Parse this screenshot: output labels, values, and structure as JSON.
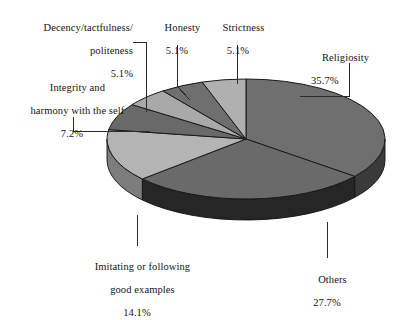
{
  "chart_data": {
    "type": "pie",
    "title": "",
    "subtitle": "",
    "xlabel": "",
    "ylabel": "",
    "units": "%",
    "three_d": true,
    "start_angle_deg": 0,
    "direction": "clockwise",
    "legend_position": "none",
    "labels_position": "outside-with-leader-lines",
    "grid": false,
    "categories": [
      "Religiosity",
      "Others",
      "Imitating or following good examples",
      "Integrity and harmony with the self",
      "Decency/tactfulness/politeness",
      "Honesty",
      "Strictness"
    ],
    "values": [
      35.7,
      27.7,
      14.1,
      7.2,
      5.1,
      5.1,
      5.1
    ],
    "slices": [
      {
        "name": "Religiosity",
        "label_line1": "Religiosity",
        "label_line2": "",
        "percent": "35.7%",
        "value": 35.7,
        "color": "#6f6f6f",
        "side_color": "#3a3a3a"
      },
      {
        "name": "Others",
        "label_line1": "Others",
        "label_line2": "",
        "percent": "27.7%",
        "value": 27.7,
        "color": "#6a6a6a",
        "side_color": "#262626"
      },
      {
        "name": "Imitating or following good examples",
        "label_line1": "Imitating or following",
        "label_line2": "good examples",
        "percent": "14.1%",
        "value": 14.1,
        "color": "#b4b4b4",
        "side_color": "#7d7d7d"
      },
      {
        "name": "Integrity and harmony with the self",
        "label_line1": "Integrity and",
        "label_line2": "harmony with the self",
        "percent": "7.2%",
        "value": 7.2,
        "color": "#696969",
        "side_color": "#3a3a3a"
      },
      {
        "name": "Decency/tactfulness/politeness",
        "label_line1": "Decency/tactfulness/",
        "label_line2": "politeness",
        "percent": "5.1%",
        "value": 5.1,
        "color": "#a9a9a9",
        "side_color": "#7d7d7d"
      },
      {
        "name": "Honesty",
        "label_line1": "Honesty",
        "label_line2": "",
        "percent": "5.1%",
        "value": 5.1,
        "color": "#6f6f6f",
        "side_color": "#3a3a3a"
      },
      {
        "name": "Strictness",
        "label_line1": "Strictness",
        "label_line2": "",
        "percent": "5.1%",
        "value": 5.1,
        "color": "#b0b0b0",
        "side_color": "#7d7d7d"
      }
    ],
    "colors": {
      "outline": "#1a1a1a",
      "leader_line": "#2b2b2b",
      "background": "#ffffff",
      "text": "#141414"
    }
  }
}
